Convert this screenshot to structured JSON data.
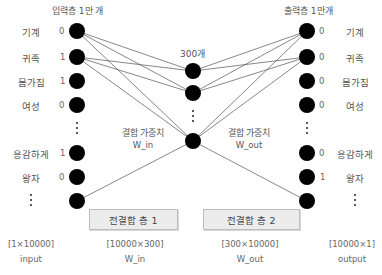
{
  "input_layer": {
    "title": "입력층 1만 개",
    "words": [
      "기계",
      "귀족",
      "몸가짐",
      "여성",
      "용감하게",
      "왕자"
    ],
    "values": [
      "0",
      "1",
      "1",
      "0",
      "1",
      "0"
    ],
    "ellipsis": "⋮"
  },
  "hidden_layer": {
    "title": "300개",
    "ellipsis": "⋮"
  },
  "output_layer": {
    "title": "출력층 1만개",
    "words": [
      "기계",
      "귀족",
      "몸가짐",
      "여성",
      "용감하게",
      "왕자"
    ],
    "values": [
      "0",
      "0",
      "0",
      "0",
      "0",
      "1"
    ],
    "ellipsis": "⋮"
  },
  "weights": {
    "in": {
      "label": "결합 가중치",
      "name": "W_in"
    },
    "out": {
      "label": "결합 가중치",
      "name": "W_out"
    }
  },
  "layers": {
    "fc1": "전결합 층 1",
    "fc2": "전결합 층 2"
  },
  "shapes": {
    "input": {
      "dims": "[1×10000]",
      "name": "input"
    },
    "w_in": {
      "dims": "[10000×300]",
      "name": "W_in"
    },
    "w_out": {
      "dims": "[300×10000]",
      "name": "W_out"
    },
    "output": {
      "dims": "[10000×1]",
      "name": "output"
    }
  },
  "colors": {
    "node": "#000000",
    "edge": "#555555",
    "box_fill": "#ececec",
    "box_border": "#bdbdbd",
    "text": "#555555"
  }
}
